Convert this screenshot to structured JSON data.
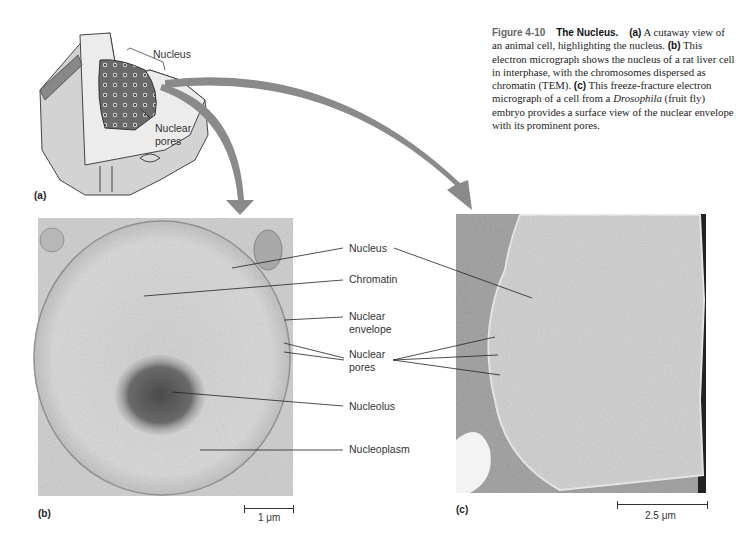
{
  "figure": {
    "number": "Figure 4-10",
    "title": "The Nucleus.",
    "caption_parts": {
      "a_tag": "(a)",
      "a_text": " A cutaway view of an animal cell, highlighting the nucleus. ",
      "b_tag": "(b)",
      "b_text": " This electron micrograph shows the nucleus of a rat liver cell in interphase, with the chromosomes dispersed as chromatin (TEM). ",
      "c_tag": "(c)",
      "c_text_1": " This freeze-fracture electron micrograph of a cell from a ",
      "c_italic": "Drosophila",
      "c_text_2": " (fruit fly) embryo provides a surface view of the nuclear envelope with its prominent pores."
    }
  },
  "panel_a": {
    "tag": "(a)",
    "labels": {
      "nucleus": "Nucleus",
      "nuclear_pores_1": "Nuclear",
      "nuclear_pores_2": "pores"
    }
  },
  "panel_b": {
    "tag": "(b)",
    "labels": {
      "nucleus": "Nucleus",
      "chromatin": "Chromatin",
      "nuclear_envelope_1": "Nuclear",
      "nuclear_envelope_2": "envelope",
      "nuclear_pores_1": "Nuclear",
      "nuclear_pores_2": "pores",
      "nucleolus": "Nucleolus",
      "nucleoplasm": "Nucleoplasm"
    },
    "scale": "1 μm"
  },
  "panel_c": {
    "tag": "(c)",
    "scale": "2.5 μm"
  },
  "colors": {
    "arrow": "#8a8a8a",
    "text": "#333333"
  }
}
